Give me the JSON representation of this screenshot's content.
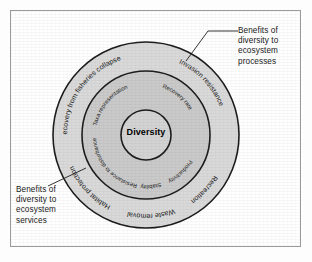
{
  "figure": {
    "colors": {
      "frame_border": "#9a9a9a",
      "outer_ring_fill": "#d8d8d8",
      "middle_ring_fill": "#c9c9c9",
      "core_fill": "#ffffff",
      "stroke": "#1a1a1a",
      "text": "#1a1a1a"
    }
  },
  "core": {
    "label": "Diversity"
  },
  "rings": {
    "middle": {
      "name": "ecosystem-processes-ring",
      "labels": [
        {
          "text": "Taxa representation",
          "angle": -126
        },
        {
          "text": "Recovery rate",
          "angle": -52
        },
        {
          "text": "Productivity",
          "angle": 50
        },
        {
          "text": "Stability",
          "angle": 86
        },
        {
          "text": "Resistance to disturbance",
          "angle": 132
        }
      ]
    },
    "outer": {
      "name": "ecosystem-services-ring",
      "labels": [
        {
          "text": "Recovery from fisheries collapse",
          "angle": -131
        },
        {
          "text": "Invasion resistance",
          "angle": -45
        },
        {
          "text": "Recreation",
          "angle": 43
        },
        {
          "text": "Waste removal",
          "angle": 84
        },
        {
          "text": "Habitat protection",
          "angle": 131
        }
      ]
    }
  },
  "annotations": [
    {
      "id": "processes",
      "text": "Benefits of\ndiversity to\necosystem\nprocesses",
      "target": "middle-ring"
    },
    {
      "id": "services",
      "text": "Benefits of\ndiversity to\necosystem\nservices",
      "target": "outer-ring"
    }
  ]
}
